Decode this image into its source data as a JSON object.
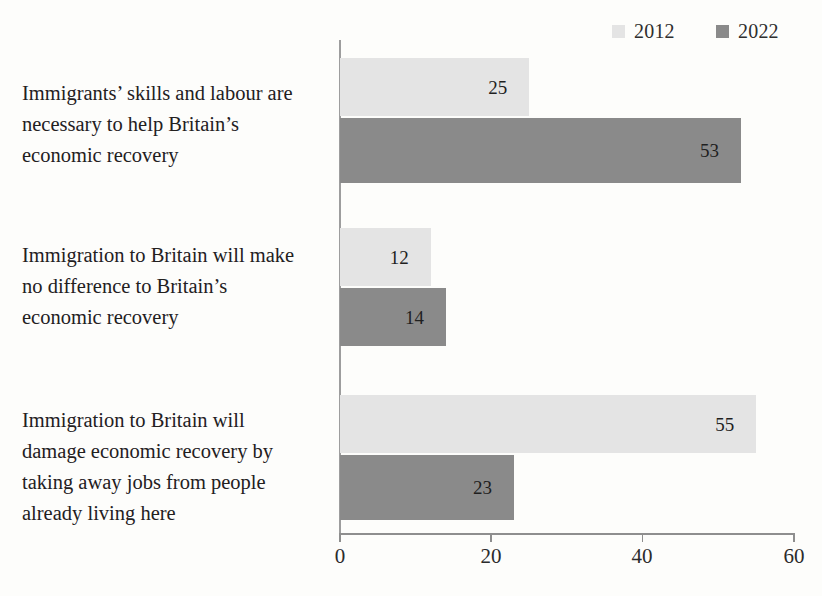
{
  "chart_data": {
    "type": "bar",
    "orientation": "horizontal",
    "title": "",
    "subtitle": "",
    "xlabel": "",
    "ylabel": "",
    "xlim": [
      0,
      60
    ],
    "xticks": [
      0,
      20,
      40,
      60
    ],
    "xtick_labels": [
      "0",
      "20",
      "40",
      "60"
    ],
    "grid": false,
    "legend_position": "top-right",
    "categories": [
      "Immigrants’ skills and labour are necessary to help Britain’s economic recovery",
      "Immigration to Britain will make no difference to Britain’s economic recovery",
      "Immigration to Britain will damage economic recovery by taking away jobs from people already living here"
    ],
    "category_lines": [
      [
        "Immigrants’ skills and labour are",
        "necessary to help Britain’s",
        "economic recovery"
      ],
      [
        "Immigration to Britain will make",
        "no difference to Britain’s",
        "economic recovery"
      ],
      [
        "Immigration to Britain will",
        "damage economic recovery by",
        "taking away jobs from people",
        "already living here"
      ]
    ],
    "series": [
      {
        "name": "2012",
        "color": "#e4e4e4",
        "values": [
          25,
          12,
          55
        ]
      },
      {
        "name": "2022",
        "color": "#8a8a8a",
        "values": [
          53,
          14,
          23
        ]
      }
    ],
    "bar_labels": [
      [
        "25",
        "12",
        "55"
      ],
      [
        "53",
        "14",
        "23"
      ]
    ]
  },
  "legend": {
    "entries": [
      {
        "label": "2012",
        "color": "#e4e4e4"
      },
      {
        "label": "2022",
        "color": "#8a8a8a"
      }
    ]
  },
  "axis": {
    "ticks": [
      "0",
      "20",
      "40",
      "60"
    ]
  }
}
